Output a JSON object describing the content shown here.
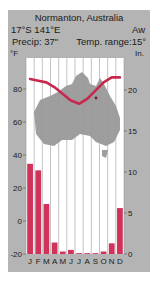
{
  "header": {
    "station": "Normanton, Australia",
    "coords": "17°S  141°E",
    "climate_class": "Aw",
    "precip": "Precip: 37\"",
    "temp_range": "Temp. range:15°"
  },
  "axes": {
    "left_unit": "°F",
    "right_unit": "In.",
    "left_ticks": [
      "80",
      "60",
      "40",
      "20",
      "0",
      "-20"
    ],
    "right_ticks": [
      "20",
      "15",
      "10",
      "5",
      "0"
    ]
  },
  "colors": {
    "panel": "#b4b4b4",
    "plot_bg": "#ffffff",
    "gridline": "#9a9a9a",
    "map": "#9e9e9e",
    "bars": "#d0325a",
    "temp_line": "#c8284e"
  },
  "chart_data": {
    "type": "bar+line",
    "title": "Normanton, Australia",
    "subtitle": "17°S 141°E  Aw  Precip: 37\"  Temp. range: 15°",
    "categories": [
      "J",
      "F",
      "M",
      "A",
      "M",
      "J",
      "J",
      "A",
      "S",
      "O",
      "N",
      "D"
    ],
    "series": [
      {
        "name": "Precipitation (in.)",
        "type": "bar",
        "axis": "right",
        "values": [
          11.0,
          10.2,
          6.1,
          1.4,
          0.3,
          0.5,
          0.1,
          0.1,
          0.1,
          0.3,
          1.3,
          5.6
        ]
      },
      {
        "name": "Temperature (°F)",
        "type": "line",
        "axis": "left",
        "values": [
          86,
          85,
          84,
          81,
          77,
          73,
          71,
          74,
          79,
          84,
          87,
          87
        ]
      }
    ],
    "ylabel_left": "°F",
    "ylabel_right": "In.",
    "ylim_left": [
      -20,
      100
    ],
    "ylim_right": [
      0,
      24
    ],
    "grid": "vertical month lines",
    "background": "Australia map silhouette with station marker"
  }
}
